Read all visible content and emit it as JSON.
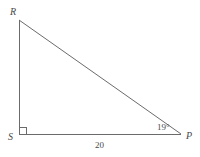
{
  "figure": {
    "type": "right-triangle",
    "background_color": "#ffffff",
    "stroke_color": "#6b6b6b",
    "label_color": "#4a4a4a",
    "vertices": [
      {
        "name": "R",
        "label": "R",
        "x": 19,
        "y": 20
      },
      {
        "name": "S",
        "label": "S",
        "x": 19,
        "y": 134
      },
      {
        "name": "P",
        "label": "P",
        "x": 181,
        "y": 134
      }
    ],
    "sides": [
      {
        "name": "RS",
        "from": "R",
        "to": "S",
        "label": ""
      },
      {
        "name": "SP",
        "from": "S",
        "to": "P",
        "label": "20"
      },
      {
        "name": "RP",
        "from": "R",
        "to": "P",
        "label": ""
      }
    ],
    "angles": [
      {
        "at": "S",
        "label": "",
        "marker": "right-angle-square",
        "measure_degrees": 90
      },
      {
        "at": "P",
        "label": "19°",
        "marker": "none",
        "measure_degrees": 19
      }
    ],
    "labels": {
      "vertex_R": "R",
      "vertex_S": "S",
      "vertex_P": "P",
      "angle_at_P": "19°",
      "side_SP": "20"
    }
  }
}
